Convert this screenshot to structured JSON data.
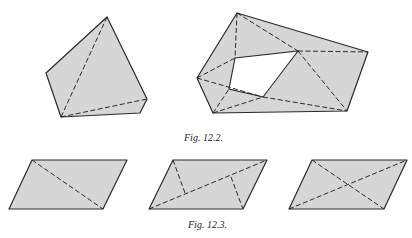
{
  "figures": [
    {
      "id": "fig-12-2",
      "caption": "Fig. 12.2.",
      "shapes": [
        {
          "name": "convex-pentagon-triangulated",
          "outline": [
            [
              107,
              17
            ],
            [
              147,
              99
            ],
            [
              140,
              113
            ],
            [
              61,
              117
            ],
            [
              46,
              73
            ]
          ],
          "dashed_diagonals": [
            [
              [
                107,
                17
              ],
              [
                61,
                117
              ]
            ],
            [
              [
                61,
                117
              ],
              [
                147,
                99
              ]
            ]
          ]
        },
        {
          "name": "polygon-with-hole-triangulated",
          "outline": [
            [
              237,
              13
            ],
            [
              368,
              52
            ],
            [
              347,
              111
            ],
            [
              213,
              113
            ],
            [
              197,
              78
            ]
          ],
          "hole": [
            [
              235,
              58
            ],
            [
              298,
              51
            ],
            [
              263,
              97
            ],
            [
              229,
              89
            ]
          ],
          "dashed_diagonals": [
            [
              [
                237,
                13
              ],
              [
                235,
                58
              ]
            ],
            [
              [
                237,
                13
              ],
              [
                298,
                51
              ]
            ],
            [
              [
                298,
                51
              ],
              [
                368,
                52
              ]
            ],
            [
              [
                298,
                51
              ],
              [
                347,
                111
              ]
            ],
            [
              [
                263,
                97
              ],
              [
                347,
                111
              ]
            ],
            [
              [
                197,
                78
              ],
              [
                235,
                58
              ]
            ],
            [
              [
                197,
                78
              ],
              [
                263,
                97
              ]
            ],
            [
              [
                213,
                113
              ],
              [
                229,
                89
              ]
            ],
            [
              [
                213,
                113
              ],
              [
                263,
                97
              ]
            ]
          ]
        }
      ]
    },
    {
      "id": "fig-12-3",
      "caption": "Fig. 12.3.",
      "shapes": [
        {
          "name": "parallelogram-one-diagonal",
          "outline": [
            [
              32,
              160
            ],
            [
              127,
              160
            ],
            [
              103,
              209
            ],
            [
              9,
              209
            ]
          ],
          "dashed_diagonals": [
            [
              [
                32,
                160
              ],
              [
                103,
                209
              ]
            ]
          ]
        },
        {
          "name": "parallelogram-diagonal-with-perpendiculars",
          "outline": [
            [
              173,
              160
            ],
            [
              267,
              160
            ],
            [
              243,
              209
            ],
            [
              149,
              209
            ]
          ],
          "dashed_diagonals": [
            [
              [
                149,
                209
              ],
              [
                267,
                160
              ]
            ]
          ],
          "solid_segments": [
            [
              [
                173,
                160
              ],
              [
                185,
                193
              ]
            ],
            [
              [
                231,
                177
              ],
              [
                243,
                209
              ]
            ]
          ]
        },
        {
          "name": "parallelogram-both-diagonals",
          "outline": [
            [
              312,
              160
            ],
            [
              407,
              160
            ],
            [
              384,
              209
            ],
            [
              289,
              209
            ]
          ],
          "dashed_diagonals": [
            [
              [
                312,
                160
              ],
              [
                384,
                209
              ]
            ],
            [
              [
                289,
                209
              ],
              [
                407,
                160
              ]
            ]
          ]
        }
      ]
    }
  ],
  "colors": {
    "fill": "#d6d6d6",
    "stroke": "#2a2a2a",
    "background": "#ffffff"
  }
}
